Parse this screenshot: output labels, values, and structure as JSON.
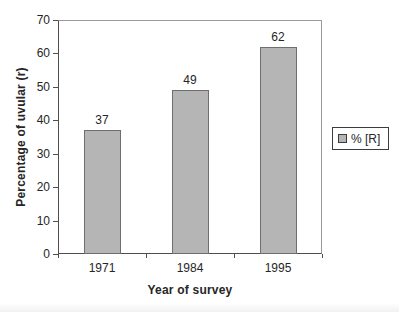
{
  "chart_data": {
    "type": "bar",
    "title": "",
    "categories": [
      "1971",
      "1984",
      "1995"
    ],
    "values": [
      37,
      49,
      62
    ],
    "data_labels": [
      "37",
      "49",
      "62"
    ],
    "xlabel": "Year of survey",
    "ylabel": "Percentage of uvular (r)",
    "ylim": [
      0,
      70
    ],
    "yticks": [
      0,
      10,
      20,
      30,
      40,
      50,
      60,
      70
    ],
    "grid": false,
    "legend": {
      "entries": [
        "% [R]"
      ],
      "position": "right"
    }
  },
  "colors": {
    "background": "#ffffff",
    "text": "#262626",
    "bar_fill": "#b5b5b5",
    "bar_border": "#6e6e6e",
    "plot_frame": "#9a9a9a",
    "axis": "#4f4f4f",
    "legend_border": "#3c3c3c"
  }
}
